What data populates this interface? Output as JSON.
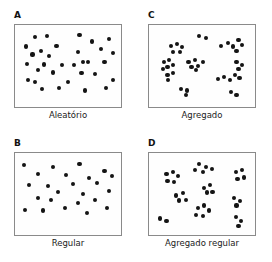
{
  "figure": {
    "background_color": "#ffffff",
    "dot_color": "#141414",
    "border_color": "#8a8a8a"
  },
  "chart_data": {
    "type": "scatter",
    "xlabel": "",
    "ylabel": "",
    "grid": false,
    "legend": "none",
    "axis_ranges": {
      "x": [
        0,
        100
      ],
      "y": [
        0,
        100
      ]
    },
    "panels": [
      {
        "letter": "A",
        "caption": "Aleatório",
        "position": "top-left",
        "count": 32,
        "points": [
          [
            16,
            10
          ],
          [
            28,
            8
          ],
          [
            62,
            7
          ],
          [
            93,
            13
          ],
          [
            75,
            16
          ],
          [
            6,
            23
          ],
          [
            38,
            22
          ],
          [
            84,
            26
          ],
          [
            22,
            29
          ],
          [
            13,
            34
          ],
          [
            30,
            36
          ],
          [
            60,
            30
          ],
          [
            97,
            32
          ],
          [
            7,
            47
          ],
          [
            25,
            48
          ],
          [
            44,
            49
          ],
          [
            66,
            45
          ],
          [
            71,
            45
          ],
          [
            88,
            44
          ],
          [
            19,
            56
          ],
          [
            56,
            49
          ],
          [
            34,
            59
          ],
          [
            64,
            60
          ],
          [
            78,
            61
          ],
          [
            8,
            70
          ],
          [
            16,
            72
          ],
          [
            50,
            72
          ],
          [
            97,
            69
          ],
          [
            23,
            82
          ],
          [
            41,
            80
          ],
          [
            68,
            84
          ],
          [
            90,
            81
          ]
        ]
      },
      {
        "letter": "B",
        "caption": "Regular",
        "position": "bottom-left",
        "count": 24,
        "points": [
          [
            4,
            10
          ],
          [
            34,
            13
          ],
          [
            62,
            8
          ],
          [
            88,
            18
          ],
          [
            19,
            22
          ],
          [
            48,
            24
          ],
          [
            72,
            28
          ],
          [
            96,
            25
          ],
          [
            9,
            37
          ],
          [
            29,
            39
          ],
          [
            55,
            36
          ],
          [
            80,
            35
          ],
          [
            40,
            47
          ],
          [
            66,
            50
          ],
          [
            93,
            46
          ],
          [
            19,
            55
          ],
          [
            32,
            58
          ],
          [
            60,
            62
          ],
          [
            78,
            58
          ],
          [
            5,
            72
          ],
          [
            24,
            73
          ],
          [
            47,
            70
          ],
          [
            70,
            76
          ],
          [
            91,
            70
          ]
        ]
      },
      {
        "letter": "C",
        "caption": "Agregado",
        "position": "top-right",
        "count": 40,
        "points": [
          [
            47,
            8
          ],
          [
            54,
            11
          ],
          [
            18,
            22
          ],
          [
            24,
            19
          ],
          [
            29,
            24
          ],
          [
            20,
            30
          ],
          [
            27,
            31
          ],
          [
            70,
            22
          ],
          [
            77,
            18
          ],
          [
            82,
            23
          ],
          [
            88,
            14
          ],
          [
            92,
            21
          ],
          [
            86,
            29
          ],
          [
            10,
            45
          ],
          [
            16,
            42
          ],
          [
            14,
            51
          ],
          [
            20,
            49
          ],
          [
            9,
            54
          ],
          [
            36,
            45
          ],
          [
            43,
            42
          ],
          [
            39,
            51
          ],
          [
            46,
            50
          ],
          [
            51,
            45
          ],
          [
            44,
            56
          ],
          [
            86,
            44
          ],
          [
            92,
            49
          ],
          [
            88,
            54
          ],
          [
            14,
            62
          ],
          [
            20,
            60
          ],
          [
            15,
            70
          ],
          [
            67,
            68
          ],
          [
            73,
            65
          ],
          [
            79,
            69
          ],
          [
            84,
            62
          ],
          [
            89,
            67
          ],
          [
            28,
            82
          ],
          [
            34,
            84
          ],
          [
            33,
            90
          ],
          [
            80,
            86
          ],
          [
            86,
            90
          ]
        ]
      },
      {
        "letter": "D",
        "caption": "Agregado regular",
        "position": "bottom-right",
        "count": 34,
        "points": [
          [
            47,
            8
          ],
          [
            54,
            13
          ],
          [
            43,
            17
          ],
          [
            51,
            20
          ],
          [
            60,
            15
          ],
          [
            13,
            22
          ],
          [
            20,
            19
          ],
          [
            25,
            25
          ],
          [
            14,
            32
          ],
          [
            21,
            33
          ],
          [
            85,
            20
          ],
          [
            92,
            17
          ],
          [
            87,
            29
          ],
          [
            94,
            27
          ],
          [
            52,
            42
          ],
          [
            58,
            38
          ],
          [
            55,
            48
          ],
          [
            61,
            47
          ],
          [
            23,
            52
          ],
          [
            30,
            49
          ],
          [
            26,
            59
          ],
          [
            33,
            58
          ],
          [
            83,
            56
          ],
          [
            90,
            60
          ],
          [
            86,
            66
          ],
          [
            46,
            70
          ],
          [
            52,
            66
          ],
          [
            57,
            73
          ],
          [
            44,
            79
          ],
          [
            51,
            80
          ],
          [
            6,
            84
          ],
          [
            13,
            88
          ],
          [
            85,
            82
          ],
          [
            91,
            88
          ],
          [
            88,
            94
          ]
        ]
      }
    ]
  }
}
